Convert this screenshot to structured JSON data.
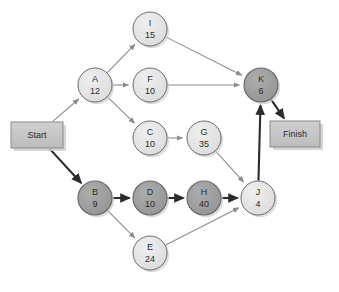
{
  "diagram": {
    "type": "project-network-diagram",
    "width": 339,
    "height": 292,
    "background": "#ffffff",
    "colors": {
      "node_normal_fill": "#e2e2e2",
      "node_critical_fill": "#9e9e9e",
      "node_stroke": "#6b6b6b",
      "terminal_fill": "#c4c4c4",
      "terminal_stroke": "#8a8a8a",
      "edge_normal": "#8c8c8c",
      "edge_critical": "#2b2b2b",
      "text": "#2b2b2b",
      "shadow": "#cfcfcf"
    },
    "node_radius": 17
  },
  "terminals": [
    {
      "id": "start",
      "label": "Start",
      "x": 11,
      "y": 122,
      "width": 52,
      "height": 26,
      "critical": true
    },
    {
      "id": "finish",
      "label": "Finish",
      "x": 270,
      "y": 121,
      "width": 50,
      "height": 26,
      "critical": true
    }
  ],
  "nodes": [
    {
      "id": "I",
      "label": "I",
      "duration": "15",
      "cx": 150,
      "cy": 29,
      "critical": false
    },
    {
      "id": "A",
      "label": "A",
      "duration": "12",
      "cx": 95,
      "cy": 85,
      "critical": false
    },
    {
      "id": "F",
      "label": "F",
      "duration": "10",
      "cx": 150,
      "cy": 85,
      "critical": false
    },
    {
      "id": "K",
      "label": "K",
      "duration": "6",
      "cx": 261,
      "cy": 85,
      "critical": true
    },
    {
      "id": "C",
      "label": "C",
      "duration": "10",
      "cx": 150,
      "cy": 138,
      "critical": false
    },
    {
      "id": "G",
      "label": "G",
      "duration": "35",
      "cx": 204,
      "cy": 138,
      "critical": false
    },
    {
      "id": "B",
      "label": "B",
      "duration": "9",
      "cx": 95,
      "cy": 198,
      "critical": true
    },
    {
      "id": "D",
      "label": "D",
      "duration": "10",
      "cx": 150,
      "cy": 198,
      "critical": true
    },
    {
      "id": "H",
      "label": "H",
      "duration": "40",
      "cx": 204,
      "cy": 198,
      "critical": true
    },
    {
      "id": "J",
      "label": "J",
      "duration": "4",
      "cx": 258,
      "cy": 198,
      "critical": false
    },
    {
      "id": "E",
      "label": "E",
      "duration": "24",
      "cx": 150,
      "cy": 253,
      "critical": false
    }
  ],
  "edges": [
    {
      "from": "start",
      "to": "A",
      "critical": false
    },
    {
      "from": "start",
      "to": "B",
      "critical": true
    },
    {
      "from": "A",
      "to": "I",
      "critical": false
    },
    {
      "from": "A",
      "to": "F",
      "critical": false
    },
    {
      "from": "A",
      "to": "C",
      "critical": false
    },
    {
      "from": "I",
      "to": "K",
      "critical": false
    },
    {
      "from": "F",
      "to": "K",
      "critical": false
    },
    {
      "from": "C",
      "to": "G",
      "critical": false
    },
    {
      "from": "G",
      "to": "J",
      "critical": false
    },
    {
      "from": "B",
      "to": "D",
      "critical": true
    },
    {
      "from": "B",
      "to": "E",
      "critical": false
    },
    {
      "from": "D",
      "to": "H",
      "critical": true
    },
    {
      "from": "H",
      "to": "J",
      "critical": true
    },
    {
      "from": "E",
      "to": "J",
      "critical": false
    },
    {
      "from": "J",
      "to": "K",
      "critical": true
    },
    {
      "from": "K",
      "to": "finish",
      "critical": true
    }
  ],
  "chart_data": {
    "type": "diagram",
    "critical_path": [
      "Start",
      "B",
      "D",
      "H",
      "J",
      "K",
      "Finish"
    ],
    "activities": [
      {
        "name": "A",
        "duration": 12,
        "predecessors": [
          "Start"
        ],
        "successors": [
          "I",
          "F",
          "C"
        ]
      },
      {
        "name": "B",
        "duration": 9,
        "predecessors": [
          "Start"
        ],
        "successors": [
          "D",
          "E"
        ]
      },
      {
        "name": "C",
        "duration": 10,
        "predecessors": [
          "A"
        ],
        "successors": [
          "G"
        ]
      },
      {
        "name": "D",
        "duration": 10,
        "predecessors": [
          "B"
        ],
        "successors": [
          "H"
        ]
      },
      {
        "name": "E",
        "duration": 24,
        "predecessors": [
          "B"
        ],
        "successors": [
          "J"
        ]
      },
      {
        "name": "F",
        "duration": 10,
        "predecessors": [
          "A"
        ],
        "successors": [
          "K"
        ]
      },
      {
        "name": "G",
        "duration": 35,
        "predecessors": [
          "C"
        ],
        "successors": [
          "J"
        ]
      },
      {
        "name": "H",
        "duration": 40,
        "predecessors": [
          "D"
        ],
        "successors": [
          "J"
        ]
      },
      {
        "name": "I",
        "duration": 15,
        "predecessors": [
          "A"
        ],
        "successors": [
          "K"
        ]
      },
      {
        "name": "J",
        "duration": 4,
        "predecessors": [
          "G",
          "H",
          "E"
        ],
        "successors": [
          "K"
        ]
      },
      {
        "name": "K",
        "duration": 6,
        "predecessors": [
          "I",
          "F",
          "J"
        ],
        "successors": [
          "Finish"
        ]
      }
    ]
  }
}
